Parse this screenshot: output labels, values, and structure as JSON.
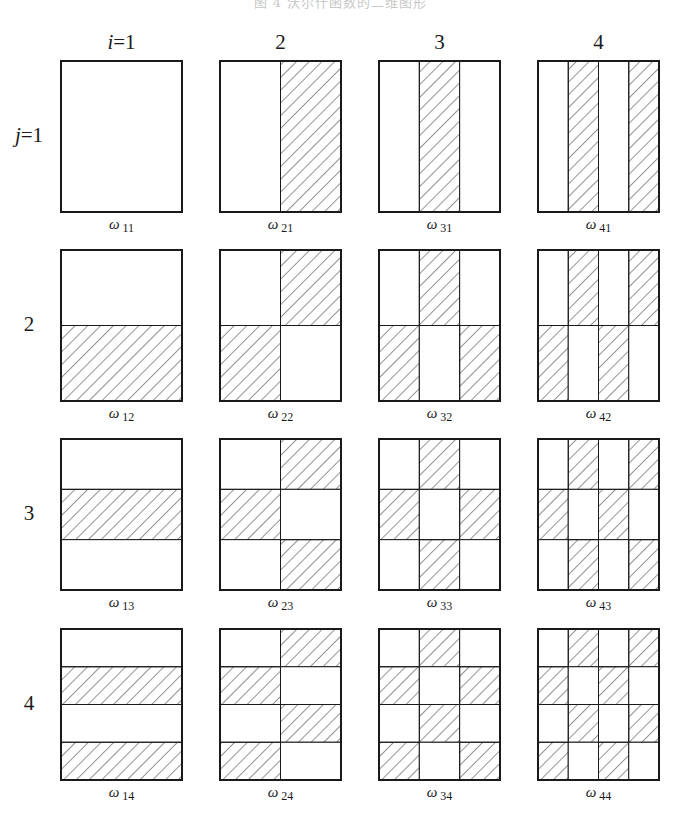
{
  "caption": "图 4  沃尔什函数的二维图形",
  "column_labels": [
    {
      "var": "i",
      "eq": "=",
      "value": "1"
    },
    {
      "var": "",
      "eq": "",
      "value": "2"
    },
    {
      "var": "",
      "eq": "",
      "value": "3"
    },
    {
      "var": "",
      "eq": "",
      "value": "4"
    }
  ],
  "row_labels": [
    {
      "var": "j",
      "eq": "=",
      "value": "1"
    },
    {
      "var": "",
      "eq": "",
      "value": "2"
    },
    {
      "var": "",
      "eq": "",
      "value": "3"
    },
    {
      "var": "",
      "eq": "",
      "value": "4"
    }
  ],
  "grid": {
    "col_x": [
      61,
      220,
      379,
      538
    ],
    "row_y": [
      61,
      250,
      439,
      629
    ],
    "panel_width": 121,
    "panel_height": 151,
    "rule": "panel (i,j) divided into i columns x j rows; cell (c,r) hatched when (c+r) is odd"
  },
  "panels": [
    {
      "symbol": "ω",
      "index": "11",
      "i": 1,
      "j": 1
    },
    {
      "symbol": "ω",
      "index": "21",
      "i": 2,
      "j": 1
    },
    {
      "symbol": "ω",
      "index": "31",
      "i": 3,
      "j": 1
    },
    {
      "symbol": "ω",
      "index": "41",
      "i": 4,
      "j": 1
    },
    {
      "symbol": "ω",
      "index": "12",
      "i": 1,
      "j": 2
    },
    {
      "symbol": "ω",
      "index": "22",
      "i": 2,
      "j": 2
    },
    {
      "symbol": "ω",
      "index": "32",
      "i": 3,
      "j": 2
    },
    {
      "symbol": "ω",
      "index": "42",
      "i": 4,
      "j": 2
    },
    {
      "symbol": "ω",
      "index": "13",
      "i": 1,
      "j": 3
    },
    {
      "symbol": "ω",
      "index": "23",
      "i": 2,
      "j": 3
    },
    {
      "symbol": "ω",
      "index": "33",
      "i": 3,
      "j": 3
    },
    {
      "symbol": "ω",
      "index": "43",
      "i": 4,
      "j": 3
    },
    {
      "symbol": "ω",
      "index": "14",
      "i": 1,
      "j": 4
    },
    {
      "symbol": "ω",
      "index": "24",
      "i": 2,
      "j": 4
    },
    {
      "symbol": "ω",
      "index": "34",
      "i": 3,
      "j": 4
    },
    {
      "symbol": "ω",
      "index": "44",
      "i": 4,
      "j": 4
    }
  ],
  "colors": {
    "stroke": "#1a1a1a",
    "hatch": "#2a2a2a",
    "background": "#ffffff"
  }
}
